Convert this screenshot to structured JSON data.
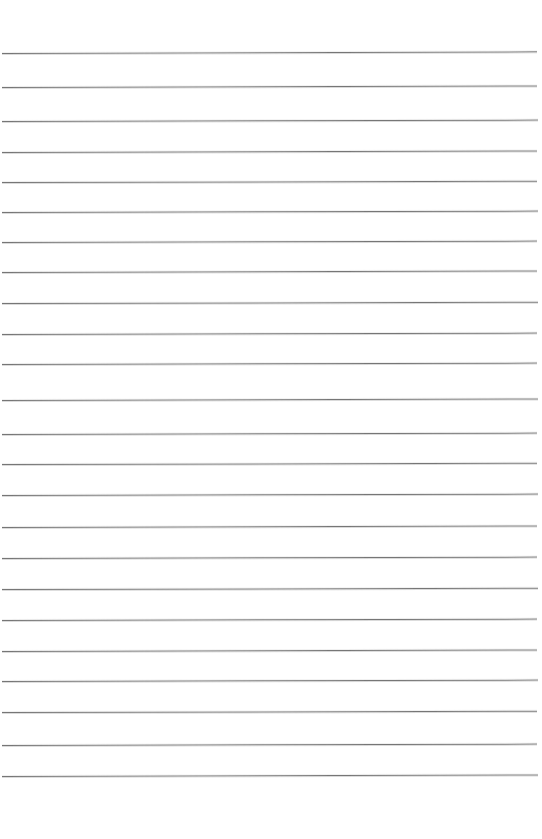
{
  "document": {
    "kind": "lined-paper-scan",
    "title": "Blank Lined Notebook Page",
    "page_width": 542,
    "page_height": 839,
    "background_color": "#ffffff",
    "rule_color": "#6b6b6b",
    "text_content": "",
    "handwriting_present": "none",
    "line_count": 24,
    "line_left_x": 2,
    "line_right_x": 537,
    "top_margin_height": 53,
    "bottom_margin_height": 63,
    "average_line_spacing": 31.4,
    "line_tilt_degrees": -0.15,
    "lines": [
      {
        "index": 1,
        "y": 53,
        "left": 2,
        "right": 537,
        "tilt": -0.18
      },
      {
        "index": 2,
        "y": 87,
        "left": 2,
        "right": 537,
        "tilt": -0.16
      },
      {
        "index": 3,
        "y": 121,
        "left": 2,
        "right": 538,
        "tilt": -0.15
      },
      {
        "index": 4,
        "y": 152,
        "left": 2,
        "right": 537,
        "tilt": -0.16
      },
      {
        "index": 5,
        "y": 182,
        "left": 2,
        "right": 537,
        "tilt": -0.14
      },
      {
        "index": 6,
        "y": 212,
        "left": 2,
        "right": 538,
        "tilt": -0.15
      },
      {
        "index": 7,
        "y": 242,
        "left": 2,
        "right": 537,
        "tilt": -0.15
      },
      {
        "index": 8,
        "y": 272,
        "left": 2,
        "right": 537,
        "tilt": -0.16
      },
      {
        "index": 9,
        "y": 303,
        "left": 2,
        "right": 538,
        "tilt": -0.14
      },
      {
        "index": 10,
        "y": 334,
        "left": 2,
        "right": 537,
        "tilt": -0.15
      },
      {
        "index": 11,
        "y": 364,
        "left": 2,
        "right": 537,
        "tilt": -0.15
      },
      {
        "index": 12,
        "y": 400,
        "left": 2,
        "right": 538,
        "tilt": -0.16
      },
      {
        "index": 13,
        "y": 434,
        "left": 2,
        "right": 537,
        "tilt": -0.15
      },
      {
        "index": 14,
        "y": 464,
        "left": 2,
        "right": 537,
        "tilt": -0.14
      },
      {
        "index": 15,
        "y": 495,
        "left": 2,
        "right": 538,
        "tilt": -0.15
      },
      {
        "index": 16,
        "y": 527,
        "left": 2,
        "right": 537,
        "tilt": -0.16
      },
      {
        "index": 17,
        "y": 558,
        "left": 2,
        "right": 537,
        "tilt": -0.15
      },
      {
        "index": 18,
        "y": 589,
        "left": 2,
        "right": 538,
        "tilt": -0.14
      },
      {
        "index": 19,
        "y": 620,
        "left": 2,
        "right": 537,
        "tilt": -0.15
      },
      {
        "index": 20,
        "y": 651,
        "left": 2,
        "right": 537,
        "tilt": -0.16
      },
      {
        "index": 21,
        "y": 681,
        "left": 2,
        "right": 538,
        "tilt": -0.15
      },
      {
        "index": 22,
        "y": 712,
        "left": 2,
        "right": 537,
        "tilt": -0.14
      },
      {
        "index": 23,
        "y": 745,
        "left": 2,
        "right": 537,
        "tilt": -0.15
      },
      {
        "index": 24,
        "y": 776,
        "left": 2,
        "right": 538,
        "tilt": -0.16
      }
    ]
  }
}
